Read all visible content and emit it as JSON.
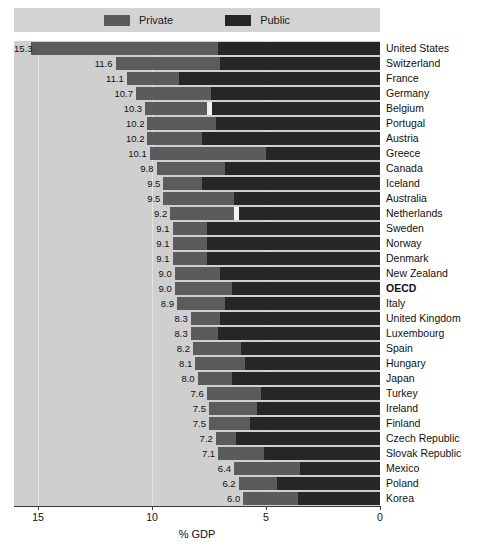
{
  "legend": {
    "items": [
      {
        "label": "Private",
        "color": "#5b5b5b",
        "name": "legend-private"
      },
      {
        "label": "Public",
        "color": "#262626",
        "name": "legend-public"
      }
    ]
  },
  "axis": {
    "title": "% GDP",
    "ticks": [
      "15",
      "10",
      "5",
      "0"
    ]
  },
  "chart_data": {
    "type": "bar",
    "title": "",
    "subtitle": "",
    "xlabel": "% GDP",
    "ylabel": "",
    "orientation": "horizontal",
    "stacked": true,
    "xlim": [
      15,
      0
    ],
    "x_axis_reversed": true,
    "grid": true,
    "legend_position": "top",
    "tick_labels": [
      "15",
      "10",
      "5",
      "0"
    ],
    "categories": [
      "United States",
      "Switzerland",
      "France",
      "Germany",
      "Belgium",
      "Portugal",
      "Austria",
      "Greece",
      "Canada",
      "Iceland",
      "Australia",
      "Netherlands",
      "Sweden",
      "Norway",
      "Denmark",
      "New Zealand",
      "OECD",
      "Italy",
      "United Kingdom",
      "Luxembourg",
      "Spain",
      "Hungary",
      "Japan",
      "Turkey",
      "Ireland",
      "Finland",
      "Czech Republic",
      "Slovak Republic",
      "Mexico",
      "Poland",
      "Korea"
    ],
    "highlight_category": "OECD",
    "totals": [
      15.3,
      11.6,
      11.1,
      10.7,
      10.3,
      10.2,
      10.2,
      10.1,
      9.8,
      9.5,
      9.5,
      9.2,
      9.1,
      9.1,
      9.1,
      9.0,
      9.0,
      8.9,
      8.3,
      8.3,
      8.2,
      8.1,
      8.0,
      7.6,
      7.5,
      7.5,
      7.2,
      7.1,
      6.4,
      6.2,
      6.0
    ],
    "series": [
      {
        "name": "Private",
        "color": "#5b5b5b",
        "values": [
          8.2,
          4.6,
          2.3,
          3.3,
          2.7,
          3.0,
          2.4,
          5.1,
          3.0,
          1.7,
          3.1,
          2.8,
          1.5,
          1.5,
          1.5,
          2.0,
          2.5,
          2.1,
          1.3,
          1.2,
          2.1,
          2.2,
          1.5,
          2.4,
          2.1,
          1.8,
          0.9,
          2.0,
          2.9,
          1.7,
          2.4
        ]
      },
      {
        "name": "Public",
        "color": "#262626",
        "values": [
          7.1,
          7.0,
          8.8,
          7.4,
          7.6,
          7.2,
          7.8,
          5.0,
          6.8,
          7.8,
          6.4,
          6.4,
          7.6,
          7.6,
          7.6,
          7.0,
          6.5,
          6.8,
          7.0,
          7.1,
          6.1,
          5.9,
          6.5,
          5.2,
          5.4,
          5.7,
          6.3,
          5.1,
          3.5,
          4.5,
          3.6
        ]
      }
    ],
    "value_labels": [
      "15.3",
      "11.6",
      "11.1",
      "10.7",
      "10.3",
      "10.2",
      "10.2",
      "10.1",
      "9.8",
      "9.5",
      "9.5",
      "9.2",
      "9.1",
      "9.1",
      "9.1",
      "9.0",
      "9.0",
      "8.9",
      "8.3",
      "8.3",
      "8.2",
      "8.1",
      "8.0",
      "7.6",
      "7.5",
      "7.5",
      "7.2",
      "7.1",
      "6.4",
      "6.2",
      "6.0"
    ]
  },
  "colors": {
    "plot_background": "#cfcfcf",
    "legend_background": "#d3d3d3",
    "gridline": "#e4e4e4",
    "private": "#5b5b5b",
    "public": "#262626",
    "text": "#111111"
  }
}
